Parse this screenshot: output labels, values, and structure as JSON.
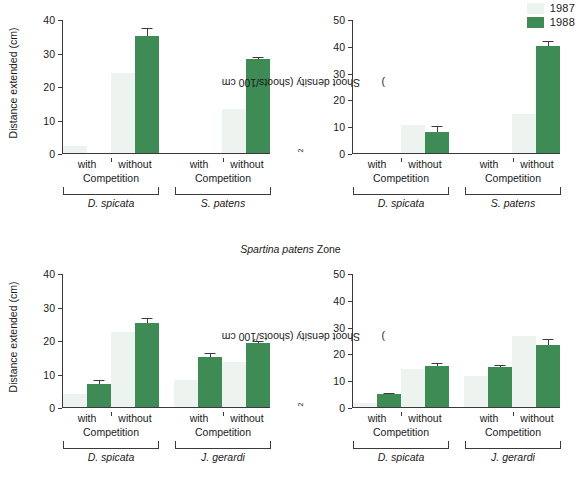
{
  "legend": {
    "items": [
      {
        "label": "1987",
        "color": "#edf3ee",
        "name": "legend-1987"
      },
      {
        "label": "1988",
        "color": "#3e8b55",
        "name": "legend-1988"
      }
    ]
  },
  "zone_title": {
    "italic": "Spartina patens",
    "rest": " Zone"
  },
  "axis_labels": {
    "distance": "Distance extended (cm)",
    "density_pre": "Shoot density (shoots/100 cm",
    "density_sup": "2",
    "density_post": ")",
    "competition": "Competition",
    "with": "with",
    "without": "without"
  },
  "chart_data": [
    {
      "id": "top-left",
      "type": "bar",
      "title": "",
      "xlabel": "Competition",
      "ylabel": "Distance extended (cm)",
      "ylim": [
        0,
        40
      ],
      "yticks": [
        0,
        10,
        20,
        30,
        40
      ],
      "grid": false,
      "legend_position": "top-right",
      "categories": [
        "D. spicata / with",
        "D. spicata / without",
        "S. patens / with",
        "S. patens / without"
      ],
      "species_groups": [
        {
          "name": "D. spicata",
          "conditions": [
            "with",
            "without"
          ]
        },
        {
          "name": "S. patens",
          "conditions": [
            "with",
            "without"
          ]
        }
      ],
      "series": [
        {
          "name": "1987",
          "values": [
            2.0,
            24.0,
            0.0,
            13.0
          ],
          "errors": [
            0,
            0,
            0,
            0
          ]
        },
        {
          "name": "1988",
          "values": [
            0.0,
            35.0,
            0.0,
            28.0
          ],
          "errors": [
            0,
            2.2,
            0,
            0.8
          ]
        }
      ]
    },
    {
      "id": "top-right",
      "type": "bar",
      "title": "",
      "xlabel": "Competition",
      "ylabel": "Shoot density (shoots/100 cm2)",
      "ylim": [
        0,
        50
      ],
      "yticks": [
        0,
        10,
        20,
        30,
        40,
        50
      ],
      "grid": false,
      "legend_position": "top-right",
      "categories": [
        "D. spicata / with",
        "D. spicata / without",
        "S. patens / with",
        "S. patens / without"
      ],
      "species_groups": [
        {
          "name": "D. spicata",
          "conditions": [
            "with",
            "without"
          ]
        },
        {
          "name": "S. patens",
          "conditions": [
            "with",
            "without"
          ]
        }
      ],
      "series": [
        {
          "name": "1987",
          "values": [
            0.0,
            10.5,
            0.0,
            14.5
          ],
          "errors": [
            0,
            0,
            0,
            0
          ]
        },
        {
          "name": "1988",
          "values": [
            0.0,
            8.0,
            0.0,
            40.0
          ],
          "errors": [
            0,
            2.0,
            0,
            1.8
          ]
        }
      ]
    },
    {
      "id": "bottom-left",
      "type": "bar",
      "title": "",
      "xlabel": "Competition",
      "ylabel": "Distance extended (cm)",
      "ylim": [
        0,
        40
      ],
      "yticks": [
        0,
        10,
        20,
        30,
        40
      ],
      "grid": false,
      "categories": [
        "D. spicata / with",
        "D. spicata / without",
        "J. gerardi / with",
        "J. gerardi / without"
      ],
      "species_groups": [
        {
          "name": "D. spicata",
          "conditions": [
            "with",
            "without"
          ]
        },
        {
          "name": "J. gerardi",
          "conditions": [
            "with",
            "without"
          ]
        }
      ],
      "series": [
        {
          "name": "1987",
          "values": [
            4.0,
            22.5,
            8.0,
            13.5
          ],
          "errors": [
            0,
            0,
            0,
            0
          ]
        },
        {
          "name": "1988",
          "values": [
            7.0,
            25.0,
            15.0,
            19.0
          ],
          "errors": [
            1.2,
            1.6,
            1.0,
            0.8
          ]
        }
      ]
    },
    {
      "id": "bottom-right",
      "type": "bar",
      "title": "",
      "xlabel": "Competition",
      "ylabel": "Shoot density (shoots/100 cm2)",
      "ylim": [
        0,
        50
      ],
      "yticks": [
        0,
        10,
        20,
        30,
        40,
        50
      ],
      "grid": false,
      "categories": [
        "D. spicata / with",
        "D. spicata / without",
        "J. gerardi / with",
        "J. gerardi / without"
      ],
      "species_groups": [
        {
          "name": "D. spicata",
          "conditions": [
            "with",
            "without"
          ]
        },
        {
          "name": "J. gerardi",
          "conditions": [
            "with",
            "without"
          ]
        }
      ],
      "series": [
        {
          "name": "1987",
          "values": [
            1.5,
            14.0,
            11.5,
            26.5
          ],
          "errors": [
            0,
            0,
            0,
            0
          ]
        },
        {
          "name": "1988",
          "values": [
            4.7,
            15.3,
            15.0,
            23.0
          ],
          "errors": [
            0.7,
            1.3,
            0.8,
            2.2
          ]
        }
      ]
    }
  ]
}
